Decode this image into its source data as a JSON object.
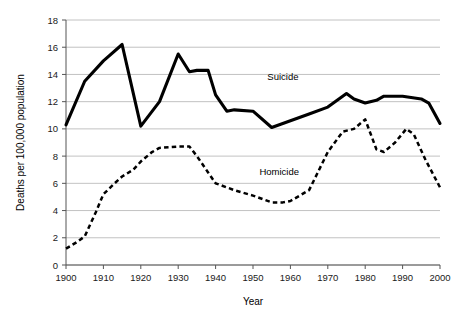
{
  "chart_data": {
    "type": "line",
    "title": "",
    "xlabel": "Year",
    "ylabel": "Deaths per 100,000 population",
    "xlim": [
      1900,
      2000
    ],
    "ylim": [
      0,
      18
    ],
    "grid": true,
    "legend": "inline-annotations",
    "x_ticks": [
      "1900",
      "1910",
      "1920",
      "1930",
      "1940",
      "1950",
      "1960",
      "1970",
      "1980",
      "1990",
      "2000"
    ],
    "x_tick_values": [
      1900,
      1910,
      1920,
      1930,
      1940,
      1950,
      1960,
      1970,
      1980,
      1990,
      2000
    ],
    "y_ticks": [
      "0",
      "2",
      "4",
      "6",
      "8",
      "10",
      "12",
      "14",
      "16",
      "18"
    ],
    "y_tick_values": [
      0,
      2,
      4,
      6,
      8,
      10,
      12,
      14,
      16,
      18
    ],
    "series": [
      {
        "name": "Suicide",
        "style": "solid",
        "color": "#000000",
        "label_x": 1958,
        "label_y": 13.6,
        "x": [
          1900,
          1905,
          1910,
          1915,
          1920,
          1925,
          1930,
          1933,
          1935,
          1938,
          1940,
          1943,
          1945,
          1950,
          1955,
          1960,
          1965,
          1970,
          1975,
          1977,
          1980,
          1983,
          1985,
          1990,
          1995,
          1997,
          2000
        ],
        "values": [
          10.3,
          13.5,
          15.0,
          16.2,
          10.2,
          12.0,
          15.5,
          14.2,
          14.3,
          14.3,
          12.5,
          11.3,
          11.4,
          11.3,
          10.1,
          10.6,
          11.1,
          11.6,
          12.6,
          12.2,
          11.9,
          12.1,
          12.4,
          12.4,
          12.2,
          11.9,
          10.4
        ]
      },
      {
        "name": "Homicide",
        "style": "dashed",
        "color": "#000000",
        "label_x": 1957,
        "label_y": 6.6,
        "x": [
          1900,
          1903,
          1905,
          1908,
          1910,
          1913,
          1915,
          1918,
          1920,
          1923,
          1925,
          1930,
          1933,
          1935,
          1938,
          1940,
          1945,
          1950,
          1955,
          1958,
          1960,
          1965,
          1970,
          1974,
          1977,
          1980,
          1983,
          1985,
          1988,
          1991,
          1993,
          1996,
          2000
        ],
        "values": [
          1.2,
          1.7,
          2.1,
          3.9,
          5.2,
          6.0,
          6.5,
          7.0,
          7.6,
          8.3,
          8.6,
          8.7,
          8.7,
          8.0,
          6.8,
          6.0,
          5.5,
          5.1,
          4.6,
          4.6,
          4.7,
          5.5,
          8.3,
          9.8,
          10.0,
          10.7,
          8.5,
          8.3,
          9.0,
          10.0,
          9.6,
          7.8,
          5.7
        ]
      }
    ]
  },
  "plot_geometry": {
    "left": 66,
    "right": 440,
    "top": 20,
    "bottom": 265
  }
}
